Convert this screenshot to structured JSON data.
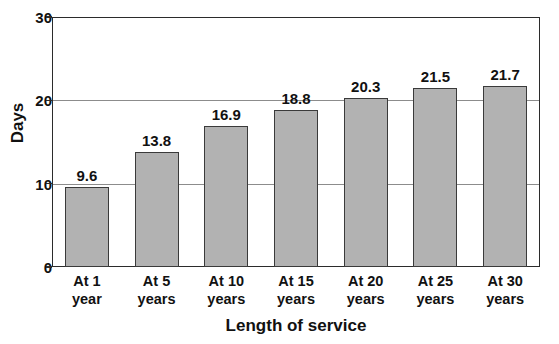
{
  "chart_data": {
    "type": "bar",
    "title": "",
    "subtitle": "",
    "xlabel": "Length of service",
    "ylabel": "Days",
    "categories": [
      "At 1 year",
      "At 5 years",
      "At 10 years",
      "At 15 years",
      "At 20 years",
      "At 25 years",
      "At 30 years"
    ],
    "category_lines": [
      [
        "At 1",
        "year"
      ],
      [
        "At 5",
        "years"
      ],
      [
        "At 10",
        "years"
      ],
      [
        "At 15",
        "years"
      ],
      [
        "At 20",
        "years"
      ],
      [
        "At 25",
        "years"
      ],
      [
        "At 30",
        "years"
      ]
    ],
    "values": [
      9.6,
      13.8,
      16.9,
      18.8,
      20.3,
      21.5,
      21.7
    ],
    "value_labels": [
      "9.6",
      "13.8",
      "16.9",
      "18.8",
      "20.3",
      "21.5",
      "21.7"
    ],
    "ylim": [
      0,
      30
    ],
    "yticks": [
      0,
      10,
      20,
      30
    ],
    "ytick_labels": [
      "0",
      "10",
      "20",
      "30"
    ],
    "grid": "horizontal",
    "gridline_values": [
      10,
      20
    ],
    "legend": "none",
    "legend_position": "none",
    "bar_color": "#b2b2b2",
    "bar_border_color": "#3a3a3a",
    "axis_color": "#2b2b2b",
    "gridline_color": "#8c8c8c",
    "text_color": "#111111",
    "background_color": "#ffffff"
  }
}
